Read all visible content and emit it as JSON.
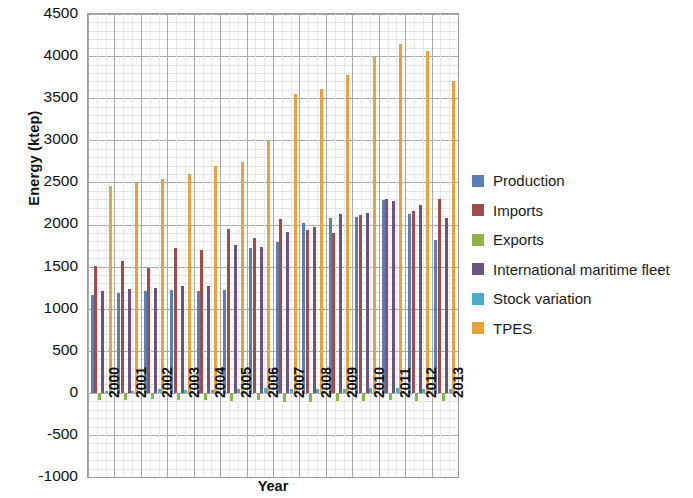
{
  "chart_data": {
    "type": "bar",
    "title": "",
    "xlabel": "Year",
    "ylabel": "Energy (ktep)",
    "ylim": [
      -1000,
      4500
    ],
    "ytick_step": 500,
    "yticks": [
      4500,
      4000,
      3500,
      3000,
      2500,
      2000,
      1500,
      1000,
      500,
      0,
      -500,
      -1000
    ],
    "grid": true,
    "legend_position": "right",
    "categories": [
      "2000",
      "2001",
      "2002",
      "2003",
      "2004",
      "2005",
      "2006",
      "2007",
      "2008",
      "2009",
      "2010",
      "2011",
      "2012",
      "2013"
    ],
    "series": [
      {
        "name": "Production",
        "color": "#5B7FB5",
        "values": [
          1160,
          1185,
          1215,
          1225,
          1215,
          1225,
          1715,
          1790,
          2020,
          2080,
          2090,
          2290,
          2130,
          1810
        ]
      },
      {
        "name": "Imports",
        "color": "#9E4C4C",
        "values": [
          1510,
          1565,
          1480,
          1725,
          1700,
          1945,
          1845,
          2060,
          1930,
          1895,
          2110,
          2300,
          2165,
          2300
        ]
      },
      {
        "name": "Exports",
        "color": "#8FB34A",
        "values": [
          -80,
          -85,
          -75,
          -80,
          -90,
          -95,
          -85,
          -110,
          -105,
          -95,
          -100,
          -90,
          -95,
          -95
        ]
      },
      {
        "name": "International maritime fleet",
        "color": "#6A5480",
        "values": [
          1215,
          1235,
          1245,
          1265,
          1265,
          1760,
          1730,
          1910,
          1975,
          2120,
          2135,
          2275,
          2230,
          2080
        ]
      },
      {
        "name": "Stock variation",
        "color": "#4BACC6",
        "values": [
          20,
          25,
          40,
          30,
          35,
          45,
          55,
          40,
          50,
          45,
          55,
          60,
          50,
          45
        ]
      },
      {
        "name": "TPES",
        "color": "#E8A33D",
        "values": [
          2455,
          2495,
          2540,
          2605,
          2700,
          2740,
          2990,
          3545,
          3605,
          3775,
          3985,
          4140,
          4055,
          3700
        ]
      }
    ]
  },
  "axes": {
    "y_title": "Energy (ktep)",
    "x_title": "Year"
  },
  "legend": {
    "entries": [
      {
        "label": "Production",
        "color": "#5B7FB5"
      },
      {
        "label": "Imports",
        "color": "#9E4C4C"
      },
      {
        "label": "Exports",
        "color": "#8FB34A"
      },
      {
        "label": "International maritime fleet",
        "color": "#6A5480"
      },
      {
        "label": "Stock variation",
        "color": "#4BACC6"
      },
      {
        "label": "TPES",
        "color": "#E8A33D"
      }
    ]
  }
}
